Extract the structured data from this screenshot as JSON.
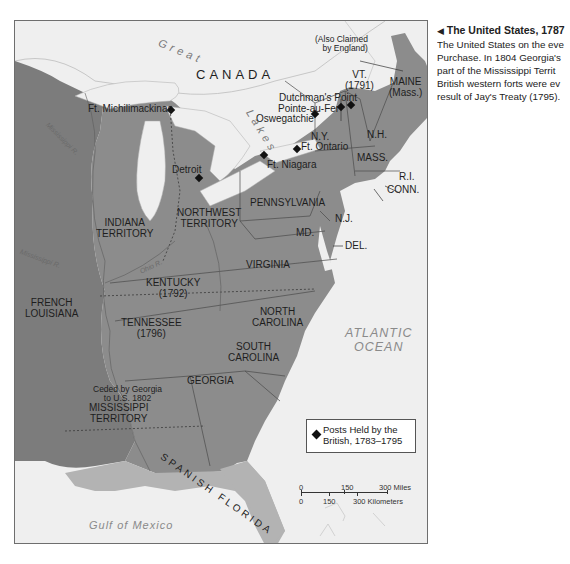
{
  "caption": {
    "arrow": "◀",
    "title": "The United States, 1787",
    "lines": [
      "The United States on the eve",
      "Purchase. In 1804 Georgia's",
      "part of the Mississippi Territ",
      "British western forts were ev",
      "result of Jay's Treaty (1795)."
    ]
  },
  "map": {
    "water_labels": {
      "great_lakes_1": "Great",
      "great_lakes_2": "Lakes",
      "atlantic_1": "ATLANTIC",
      "atlantic_2": "OCEAN",
      "gulf": "Gulf of Mexico"
    },
    "rivers": {
      "mississippi_upper": "Mississippi R.",
      "mississippi_lower": "Mississippi R.",
      "ohio": "Ohio R."
    },
    "regions": {
      "canada": "CANADA",
      "also_claimed_1": "(Also Claimed",
      "also_claimed_2": "by England)",
      "vt_1": "VT.",
      "vt_2": "(1791)",
      "maine_1": "MAINE",
      "maine_2": "(Mass.)",
      "ny": "N.Y.",
      "nh": "N.H.",
      "mass": "MASS.",
      "ri": "R.I.",
      "conn": "CONN.",
      "pennsylvania": "PENNSYLVANIA",
      "nj": "N.J.",
      "md": "MD.",
      "del": "DEL.",
      "northwest_1": "NORTHWEST",
      "northwest_2": "TERRITORY",
      "indiana_1": "INDIANA",
      "indiana_2": "TERRITORY",
      "virginia": "VIRGINIA",
      "kentucky_1": "KENTUCKY",
      "kentucky_2": "(1792)",
      "tennessee_1": "TENNESSEE",
      "tennessee_2": "(1796)",
      "nc_1": "NORTH",
      "nc_2": "CAROLINA",
      "sc_1": "SOUTH",
      "sc_2": "CAROLINA",
      "georgia": "GEORGIA",
      "ceded_1": "Ceded by Georgia",
      "ceded_2": "to U.S. 1802",
      "mississippi_1": "MISSISSIPPI",
      "mississippi_2": "TERRITORY",
      "french_la_1": "FRENCH",
      "french_la_2": "LOUISIANA",
      "spanish_florida": "SPANISH FLORIDA"
    },
    "forts": [
      {
        "name": "Ft. Michilimackinac"
      },
      {
        "name": "Detroit"
      },
      {
        "name": "Dutchman's Point"
      },
      {
        "name": "Pointe-au-Fer"
      },
      {
        "name": "Oswegatchie"
      },
      {
        "name": "Ft. Ontario"
      },
      {
        "name": "Ft. Niagara"
      }
    ],
    "legend": {
      "line1": "Posts Held by the",
      "line2": "British, 1783–1795"
    },
    "scale": {
      "miles_0": "0",
      "miles_150": "150",
      "miles_300": "300 Miles",
      "km_0": "0",
      "km_150": "150",
      "km_300": "300 Kilometers"
    },
    "colors": {
      "us_land": "#8c8c8c",
      "foreign_land": "#7d7d7d",
      "spanish": "#b5b5b5",
      "water": "#efefef",
      "canada_land": "#f2f2f2"
    }
  }
}
